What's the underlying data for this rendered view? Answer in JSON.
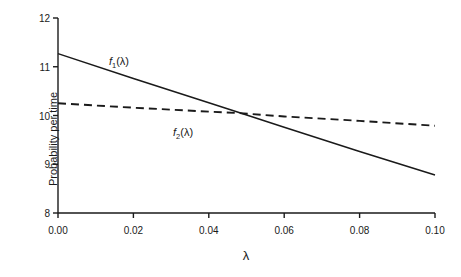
{
  "chart_data": {
    "type": "line",
    "title": "",
    "xlabel": "λ",
    "ylabel": "Probability per time",
    "xlim": [
      0.0,
      0.1
    ],
    "ylim": [
      8,
      12
    ],
    "xticks": [
      0.0,
      0.02,
      0.04,
      0.06,
      0.08,
      0.1
    ],
    "xtick_labels": [
      "0.00",
      "0.02",
      "0.04",
      "0.06",
      "0.08",
      "0.10"
    ],
    "yticks": [
      8,
      9,
      10,
      11,
      12
    ],
    "ytick_labels": [
      "8",
      "9",
      "10",
      "11",
      "12"
    ],
    "grid": false,
    "legend_position": "inline-annotations",
    "series": [
      {
        "name": "f1",
        "label": "f₁(λ)",
        "label_base": "f",
        "label_sub": "1",
        "label_arg": "(λ)",
        "style": "solid",
        "color": "#1a1a1a",
        "x": [
          0.0,
          0.02,
          0.04,
          0.048,
          0.06,
          0.08,
          0.1
        ],
        "values": [
          11.27,
          10.76,
          10.26,
          10.06,
          9.76,
          9.26,
          8.78
        ]
      },
      {
        "name": "f2",
        "label": "f₂(λ)",
        "label_base": "f",
        "label_sub": "2",
        "label_arg": "(λ)",
        "style": "dashed",
        "color": "#1a1a1a",
        "x": [
          0.0,
          0.02,
          0.04,
          0.048,
          0.06,
          0.08,
          0.1
        ],
        "values": [
          10.25,
          10.16,
          10.08,
          10.05,
          9.98,
          9.89,
          9.79
        ]
      }
    ],
    "annotations": [
      {
        "text": "f₁(λ)",
        "x": 0.0135,
        "y": 11.1
      },
      {
        "text": "f₂(λ)",
        "x": 0.0305,
        "y": 9.65
      }
    ]
  }
}
